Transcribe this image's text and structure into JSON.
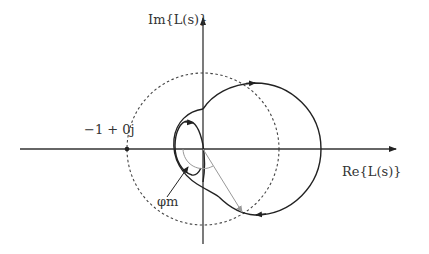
{
  "diagram": {
    "type": "nyquist-plot",
    "axes": {
      "real_label": "Re{L(s)}",
      "imag_label": "Im{L(s)}",
      "origin_px": [
        203,
        149
      ]
    },
    "critical_point": {
      "label": "−1 + 0j",
      "position_px": [
        127,
        149
      ]
    },
    "unit_circle": {
      "style": "dashed",
      "radius_px": 76
    },
    "phase_margin": {
      "label": "φm"
    },
    "colors": {
      "curve": "#222222",
      "axis": "#333333",
      "unit_circle": "#444444",
      "phase_ray": "#999999"
    }
  }
}
